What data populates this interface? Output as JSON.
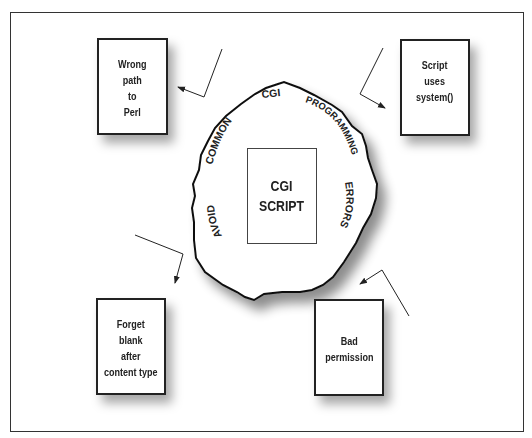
{
  "diagram": {
    "center": {
      "label": "CGI\nSCRIPT",
      "ring_words": [
        "AVOID",
        "COMMON",
        "CGI",
        "PROGRAMMING",
        "ERRORS"
      ]
    },
    "errors": [
      {
        "id": "wrong-path",
        "label": "Wrong\npath\nto\nPerl",
        "position": "top-left"
      },
      {
        "id": "system-call",
        "label": "Script\nuses\nsystem()",
        "position": "top-right"
      },
      {
        "id": "forget-blank",
        "label": "Forget\nblank\nafter\ncontent type",
        "position": "bottom-left"
      },
      {
        "id": "bad-permission",
        "label": "Bad\npermission",
        "position": "bottom-right"
      }
    ],
    "colors": {
      "stroke": "#222222",
      "background": "#ffffff",
      "shadow": "#888888"
    }
  }
}
